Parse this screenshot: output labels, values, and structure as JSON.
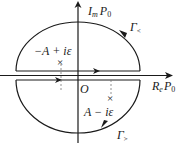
{
  "diagram": {
    "type": "contour-integration",
    "axes": {
      "vertical_label_main": "I",
      "vertical_label_sub": "m",
      "vertical_label_var": "P",
      "vertical_label_var_sub": "0",
      "horizontal_label_main": "R",
      "horizontal_label_sub": "e",
      "horizontal_label_var": "P",
      "horizontal_label_var_sub": "0",
      "origin_label": "O"
    },
    "contours": [
      {
        "name": "upper",
        "label": "Γ",
        "label_sub": "<"
      },
      {
        "name": "lower",
        "label": "Γ",
        "label_sub": ">"
      }
    ],
    "poles": [
      {
        "name": "upper-left-pole",
        "marker": "×",
        "label": "−A + iε"
      },
      {
        "name": "lower-right-pole",
        "marker": "×",
        "label": "A − iε"
      }
    ],
    "colors": {
      "stroke": "#1a1a1a",
      "dashed": "#777777"
    }
  }
}
